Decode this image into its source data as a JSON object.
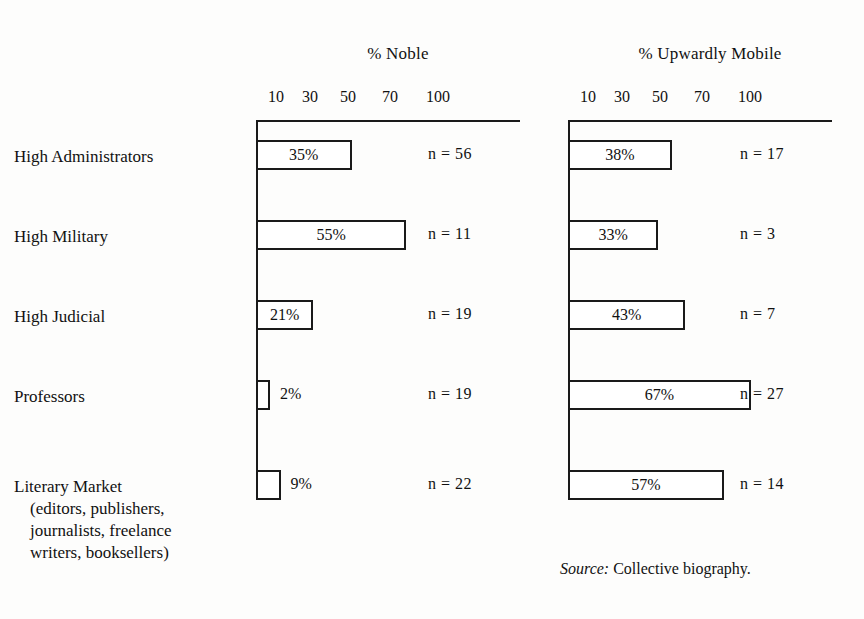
{
  "chart_data": {
    "type": "bar",
    "title": "",
    "orientation": "horizontal",
    "categories": [
      "High Administrators",
      "High Military",
      "High Judicial",
      "Professors",
      "Literary Market (editors, publishers, journalists, freelance writers, booksellers)"
    ],
    "panels": [
      {
        "title": "% Noble",
        "xlabel": "",
        "ylabel": "",
        "ticks": [
          10,
          30,
          50,
          70,
          100
        ],
        "tick_labels": [
          "10",
          "30",
          "50",
          "70",
          "100"
        ],
        "xlim": [
          0,
          100
        ],
        "grid": false,
        "values": [
          35,
          55,
          21,
          2,
          9
        ],
        "value_labels": [
          "35%",
          "55%",
          "21%",
          "2%",
          "9%"
        ],
        "n_values": [
          56,
          11,
          19,
          19,
          22
        ],
        "n_labels": [
          "n  =  56",
          "n  =  11",
          "n  =  19",
          "n  =  19",
          "n  =  22"
        ]
      },
      {
        "title": "% Upwardly Mobile",
        "xlabel": "",
        "ylabel": "",
        "ticks": [
          10,
          30,
          50,
          70,
          100
        ],
        "tick_labels": [
          "10",
          "30",
          "50",
          "70",
          "100"
        ],
        "xlim": [
          0,
          100
        ],
        "grid": false,
        "values": [
          38,
          33,
          43,
          67,
          57
        ],
        "value_labels": [
          "38%",
          "33%",
          "43%",
          "67%",
          "57%"
        ],
        "n_values": [
          17,
          3,
          7,
          27,
          14
        ],
        "n_labels": [
          "n  =  17",
          "n  =  3",
          "n  =  7",
          "n  =  27",
          "n  =  14"
        ]
      }
    ],
    "legend": null,
    "legend_position": "none",
    "annotations": [
      "Source: Collective biography."
    ]
  },
  "row_labels": [
    {
      "line1": "High Administrators",
      "line2": "",
      "line3": "",
      "line4": ""
    },
    {
      "line1": "High Military",
      "line2": "",
      "line3": "",
      "line4": ""
    },
    {
      "line1": "High Judicial",
      "line2": "",
      "line3": "",
      "line4": ""
    },
    {
      "line1": "Professors",
      "line2": "",
      "line3": "",
      "line4": ""
    },
    {
      "line1": "Literary Market",
      "line2": "(editors, publishers,",
      "line3": "journalists, freelance",
      "line4": "writers, booksellers)"
    }
  ],
  "source_note": {
    "label": "Source:",
    "text": "Collective biography."
  },
  "colors": {
    "ink": "#1a1a1a",
    "paper": "#fdfdfc",
    "bar_fill": "#ffffff"
  }
}
